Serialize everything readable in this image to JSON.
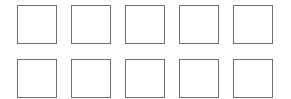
{
  "grid": {
    "rows": 2,
    "columns": 5,
    "border_color": "#6e6e6e",
    "background": "#ffffff",
    "cells": [
      {
        "row": 1,
        "col": 1,
        "label": ""
      },
      {
        "row": 1,
        "col": 2,
        "label": ""
      },
      {
        "row": 1,
        "col": 3,
        "label": ""
      },
      {
        "row": 1,
        "col": 4,
        "label": ""
      },
      {
        "row": 1,
        "col": 5,
        "label": ""
      },
      {
        "row": 2,
        "col": 1,
        "label": ""
      },
      {
        "row": 2,
        "col": 2,
        "label": ""
      },
      {
        "row": 2,
        "col": 3,
        "label": ""
      },
      {
        "row": 2,
        "col": 4,
        "label": ""
      },
      {
        "row": 2,
        "col": 5,
        "label": ""
      }
    ]
  }
}
